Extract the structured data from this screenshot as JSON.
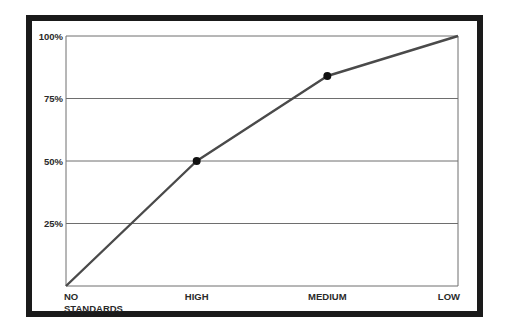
{
  "chart_data": {
    "type": "line",
    "title": "",
    "xlabel": "",
    "ylabel": "",
    "categories": [
      "NO STANDARDS",
      "HIGH",
      "MEDIUM",
      "LOW"
    ],
    "category_lines": [
      [
        "NO",
        "STANDARDS"
      ],
      [
        "HIGH"
      ],
      [
        "MEDIUM"
      ],
      [
        "LOW"
      ]
    ],
    "series": [
      {
        "name": "series-1",
        "values": [
          0,
          50,
          84,
          100
        ],
        "markers": [
          false,
          true,
          true,
          false
        ]
      }
    ],
    "ylim": [
      0,
      100
    ],
    "yticks": [
      25,
      50,
      75,
      100
    ],
    "ytick_labels": [
      "25%",
      "50%",
      "75%",
      "100%"
    ],
    "grid": "horizontal",
    "legend": "none",
    "colors": {
      "line": "#4a4a4a",
      "marker": "#111111",
      "grid": "#6e6e6e",
      "frame": "#1a1a1a"
    }
  }
}
